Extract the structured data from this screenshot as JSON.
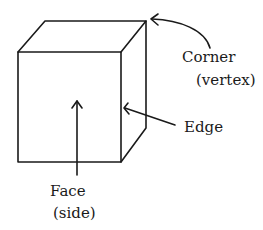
{
  "diagram": {
    "labels": {
      "corner": "Corner",
      "corner_sub": "(vertex)",
      "edge": "Edge",
      "face": "Face",
      "face_sub": "(side)"
    }
  }
}
